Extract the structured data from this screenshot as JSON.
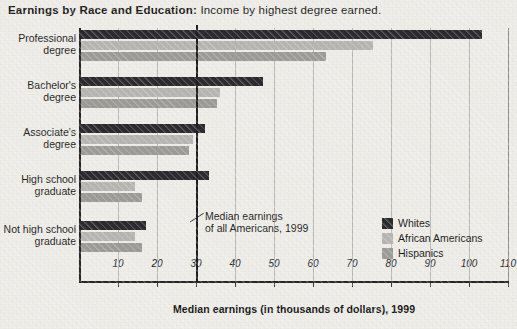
{
  "title": {
    "strong": "Earnings by Race and Education:",
    "sub": "Income by highest degree earned."
  },
  "chart_data": {
    "type": "bar",
    "orientation": "horizontal",
    "title": "Earnings by Race and Education: Income by highest degree earned.",
    "xlabel": "Median earnings (in thousands of dollars), 1999",
    "ylabel": "",
    "xlim": [
      0,
      110
    ],
    "xticks": [
      10,
      20,
      30,
      40,
      50,
      60,
      70,
      80,
      90,
      100,
      110
    ],
    "grid": true,
    "legend_position": "inside-bottom-right",
    "categories": [
      "Professional degree",
      "Bachelor's degree",
      "Associate's degree",
      "High school graduate",
      "Not high school graduate"
    ],
    "category_lines": [
      [
        "Professional",
        "degree"
      ],
      [
        "Bachelor's",
        "degree"
      ],
      [
        "Associate's",
        "degree"
      ],
      [
        "High school",
        "graduate"
      ],
      [
        "Not high school",
        "graduate"
      ]
    ],
    "series": [
      {
        "name": "Whites",
        "color": "#2b2b2f",
        "values": [
          103,
          47,
          32,
          33,
          17
        ]
      },
      {
        "name": "African Americans",
        "color": "#b6b5b1",
        "values": [
          75,
          36,
          29,
          14,
          14
        ]
      },
      {
        "name": "Hispanics",
        "color": "#9c9b97",
        "values": [
          63,
          35,
          28,
          16,
          16
        ]
      }
    ],
    "reference_line": {
      "value": 30,
      "label_line_1": "Median earnings",
      "label_line_2": "of all Americans, 1999",
      "color": "#1e1e22"
    }
  },
  "annotation": {
    "line1": "Median earnings",
    "line2": "of all Americans, 1999"
  },
  "axis": {
    "x_title": "Median earnings (in thousands of dollars), 1999"
  }
}
